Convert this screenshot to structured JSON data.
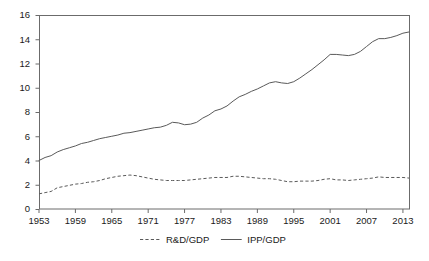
{
  "chart_data": {
    "type": "line",
    "title": "",
    "subtitle": "",
    "xlabel": "",
    "ylabel": "",
    "xlim": [
      1953,
      2014
    ],
    "ylim": [
      0,
      16
    ],
    "grid": false,
    "legend_position": "bottom-center",
    "x_ticks": [
      "1953",
      "1959",
      "1965",
      "1971",
      "1977",
      "1983",
      "1989",
      "1995",
      "2001",
      "2007",
      "2013"
    ],
    "x_tick_values": [
      1953,
      1959,
      1965,
      1971,
      1977,
      1983,
      1989,
      1995,
      2001,
      2007,
      2013
    ],
    "y_ticks": [
      "0",
      "2",
      "4",
      "6",
      "8",
      "10",
      "12",
      "14",
      "16"
    ],
    "y_tick_values": [
      0,
      2,
      4,
      6,
      8,
      10,
      12,
      14,
      16
    ],
    "x": [
      1953,
      1954,
      1955,
      1956,
      1957,
      1958,
      1959,
      1960,
      1961,
      1962,
      1963,
      1964,
      1965,
      1966,
      1967,
      1968,
      1969,
      1970,
      1971,
      1972,
      1973,
      1974,
      1975,
      1976,
      1977,
      1978,
      1979,
      1980,
      1981,
      1982,
      1983,
      1984,
      1985,
      1986,
      1987,
      1988,
      1989,
      1990,
      1991,
      1992,
      1993,
      1994,
      1995,
      1996,
      1997,
      1998,
      1999,
      2000,
      2001,
      2002,
      2003,
      2004,
      2005,
      2006,
      2007,
      2008,
      2009,
      2010,
      2011,
      2012,
      2013,
      2014
    ],
    "series": [
      {
        "name": "R&D/GDP",
        "style": "dashed",
        "color": "#5a5a5a",
        "values": [
          1.25,
          1.35,
          1.45,
          1.75,
          1.85,
          1.95,
          2.05,
          2.1,
          2.2,
          2.25,
          2.35,
          2.5,
          2.6,
          2.7,
          2.75,
          2.8,
          2.75,
          2.65,
          2.55,
          2.45,
          2.4,
          2.35,
          2.35,
          2.35,
          2.35,
          2.4,
          2.45,
          2.5,
          2.55,
          2.6,
          2.6,
          2.6,
          2.7,
          2.7,
          2.65,
          2.6,
          2.55,
          2.5,
          2.5,
          2.45,
          2.35,
          2.25,
          2.25,
          2.3,
          2.3,
          2.3,
          2.35,
          2.45,
          2.5,
          2.4,
          2.4,
          2.35,
          2.4,
          2.45,
          2.5,
          2.55,
          2.65,
          2.6,
          2.6,
          2.6,
          2.6,
          2.55
        ]
      },
      {
        "name": "IPP/GDP",
        "style": "solid",
        "color": "#5a5a5a",
        "values": [
          4.0,
          4.25,
          4.4,
          4.7,
          4.9,
          5.05,
          5.2,
          5.4,
          5.5,
          5.65,
          5.8,
          5.9,
          6.0,
          6.1,
          6.25,
          6.3,
          6.4,
          6.5,
          6.6,
          6.7,
          6.75,
          6.9,
          7.15,
          7.1,
          6.95,
          7.0,
          7.15,
          7.5,
          7.75,
          8.1,
          8.25,
          8.5,
          8.9,
          9.25,
          9.45,
          9.7,
          9.9,
          10.15,
          10.4,
          10.5,
          10.4,
          10.35,
          10.5,
          10.8,
          11.15,
          11.5,
          11.9,
          12.3,
          12.75,
          12.75,
          12.7,
          12.65,
          12.75,
          13.0,
          13.4,
          13.8,
          14.05,
          14.05,
          14.15,
          14.3,
          14.5,
          14.6
        ]
      }
    ],
    "legend": [
      {
        "label": "R&D/GDP",
        "style": "dashed"
      },
      {
        "label": "IPP/GDP",
        "style": "solid"
      }
    ]
  },
  "layout": {
    "plot_left": 39,
    "plot_right": 409,
    "plot_top": 15,
    "plot_bottom": 209
  }
}
